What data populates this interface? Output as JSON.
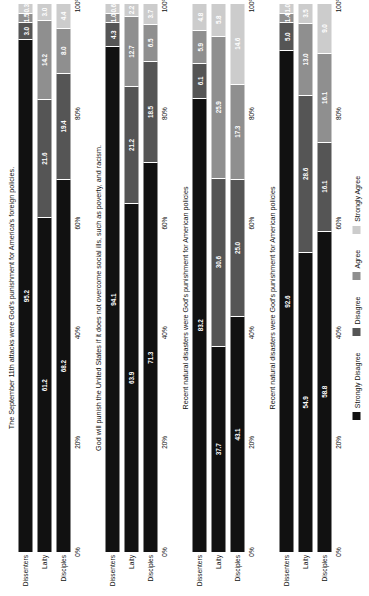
{
  "chart_data": {
    "type": "bar",
    "subtype": "stacked-percent-horizontal-faceted",
    "title": "",
    "xlabel": "",
    "ylabel": "",
    "xlim": [
      0,
      100
    ],
    "grid": false,
    "legend_position": "bottom",
    "orientation": "horizontal",
    "rotation_degrees": -90,
    "categories": [
      "Dissenters",
      "Laity",
      "Disciples"
    ],
    "series_names": [
      "Strongly Disagree",
      "Disagree",
      "Agree",
      "Strongly Agree"
    ],
    "series_colors": [
      "#111111",
      "#555555",
      "#8f8f8f",
      "#cccccc"
    ],
    "xticks": [
      "0%",
      "20%",
      "40%",
      "60%",
      "80%",
      "100%"
    ],
    "xtick_values": [
      0,
      20,
      40,
      60,
      80,
      100
    ],
    "panels": [
      {
        "title": "The September 11th attacks were God's punishment for America's foreign policies.",
        "rows": [
          {
            "category": "Dissenters",
            "values": [
              95.2,
              3.0,
              1.5,
              0.3
            ]
          },
          {
            "category": "Laity",
            "values": [
              61.2,
              21.6,
              14.2,
              3.0
            ]
          },
          {
            "category": "Disciples",
            "values": [
              68.2,
              19.4,
              8.0,
              4.4
            ]
          }
        ]
      },
      {
        "title": "God will punish the United States if it does not overcome social ills, such as poverty, and racism.",
        "rows": [
          {
            "category": "Dissenters",
            "values": [
              94.1,
              4.3,
              1.0,
              0.6
            ]
          },
          {
            "category": "Laity",
            "values": [
              63.9,
              21.2,
              12.7,
              2.2
            ]
          },
          {
            "category": "Disciples",
            "values": [
              71.3,
              18.5,
              6.5,
              3.7
            ]
          }
        ]
      },
      {
        "title": "Recent natural disasters were God's punishment for American policies",
        "rows": [
          {
            "category": "Dissenters",
            "values": [
              83.2,
              6.1,
              5.9,
              4.8
            ]
          },
          {
            "category": "Laity",
            "values": [
              37.7,
              30.6,
              25.9,
              5.8
            ]
          },
          {
            "category": "Disciples",
            "values": [
              43.1,
              25.0,
              17.3,
              14.6
            ]
          }
        ]
      },
      {
        "title": "Recent natural disasters were God's punishment for American policies",
        "rows": [
          {
            "category": "Dissenters",
            "values": [
              92.6,
              5.0,
              1.4,
              1.0
            ]
          },
          {
            "category": "Laity",
            "values": [
              54.9,
              28.6,
              13.0,
              3.5
            ]
          },
          {
            "category": "Disciples",
            "values": [
              58.8,
              16.1,
              16.1,
              9.0
            ]
          }
        ]
      }
    ]
  },
  "legend": {
    "items": [
      {
        "label": "Strongly Disagree",
        "color": "#111111"
      },
      {
        "label": "Disagree",
        "color": "#555555"
      },
      {
        "label": "Agree",
        "color": "#8f8f8f"
      },
      {
        "label": "Strongly Agree",
        "color": "#cccccc"
      }
    ]
  }
}
